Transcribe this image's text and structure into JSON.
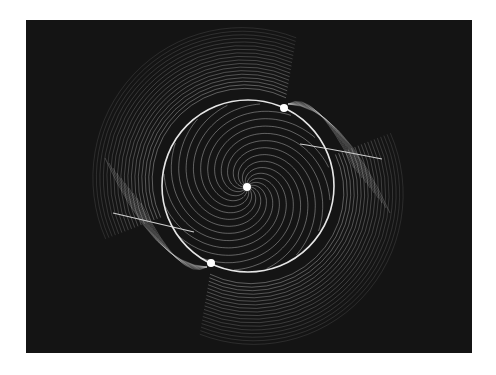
{
  "figure": {
    "type": "phase-portrait-streamlines",
    "background_color": "#141414",
    "line_color": "#d8d8d8",
    "canvas": {
      "x": 26,
      "y": 20,
      "width": 446,
      "height": 333
    }
  },
  "limit_cycle": {
    "cx": 222,
    "cy": 166,
    "r": 86,
    "color": "#e6e6e6",
    "stroke_width": 1.6
  },
  "fixed_points": [
    {
      "name": "center-fixed-point",
      "x": 221,
      "y": 167,
      "r": 4
    },
    {
      "name": "upper-saddle-point",
      "x": 258,
      "y": 88,
      "r": 4
    },
    {
      "name": "lower-saddle-point",
      "x": 185,
      "y": 243,
      "r": 4
    }
  ],
  "separatrices": [
    {
      "name": "right-separatrix",
      "points": [
        [
          274,
          124
        ],
        [
          300,
          128
        ],
        [
          356,
          139
        ]
      ]
    },
    {
      "name": "left-separatrix",
      "points": [
        [
          87,
          193
        ],
        [
          130,
          203
        ],
        [
          168,
          212
        ]
      ]
    }
  ],
  "spiral": {
    "turns": 2.6,
    "arms": 16,
    "inner_radius": 4,
    "outer_radius": 84
  },
  "outer_flow": {
    "rings": 18,
    "rx_start": 92,
    "rx_step": 3.4,
    "ry_start": 90,
    "ry_step": 3.6
  }
}
